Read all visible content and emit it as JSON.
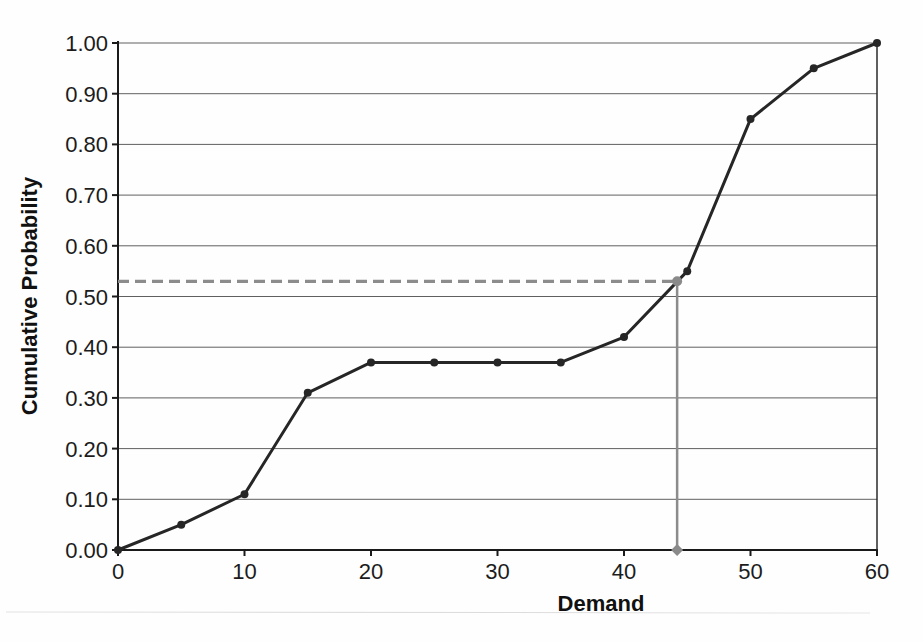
{
  "chart_data": {
    "type": "line",
    "title": "",
    "xlabel": "Demand",
    "ylabel": "Cumulative Probability",
    "x": [
      0,
      5,
      10,
      15,
      20,
      25,
      30,
      35,
      40,
      45,
      50,
      55,
      60
    ],
    "series": [
      {
        "name": "Cumulative Probability",
        "values": [
          0.0,
          0.05,
          0.11,
          0.31,
          0.37,
          0.37,
          0.37,
          0.37,
          0.42,
          0.55,
          0.85,
          0.95,
          1.0
        ],
        "color": "#262626",
        "marker": "circle"
      }
    ],
    "xlim": [
      0,
      60
    ],
    "ylim": [
      0,
      1.0
    ],
    "x_ticks": [
      0,
      10,
      20,
      30,
      40,
      50,
      60
    ],
    "y_ticks": [
      1.0,
      0.9,
      0.8,
      0.7,
      0.6,
      0.5,
      0.4,
      0.3,
      0.2,
      0.1,
      0.0
    ],
    "grid": "horizontal",
    "legend": "none",
    "annotation": {
      "type": "random-number-trace",
      "probability": 0.53,
      "demand": 44.2,
      "line_color": "#8c8c8c",
      "marker_color": "#8a8a8a"
    }
  },
  "style": {
    "grid_color": "#606060",
    "axis_color": "#1a1a1a",
    "label_color": "#1c1c1c"
  }
}
